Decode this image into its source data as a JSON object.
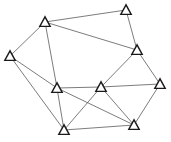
{
  "diagram": {
    "type": "undirected-graph",
    "node_shape": "triangle",
    "colors": {
      "background": "#ffffff",
      "edge": "#5a5a5a",
      "node_stroke": "#1a1a1a",
      "node_fill": "#ffffff"
    },
    "nodes": [
      {
        "id": "n1",
        "x": 45,
        "y": 22
      },
      {
        "id": "n2",
        "x": 126,
        "y": 10
      },
      {
        "id": "n3",
        "x": 10,
        "y": 56
      },
      {
        "id": "n4",
        "x": 137,
        "y": 50
      },
      {
        "id": "n5",
        "x": 57,
        "y": 88
      },
      {
        "id": "n6",
        "x": 101,
        "y": 87
      },
      {
        "id": "n7",
        "x": 160,
        "y": 84
      },
      {
        "id": "n8",
        "x": 64,
        "y": 130
      },
      {
        "id": "n9",
        "x": 134,
        "y": 125
      }
    ],
    "edges": [
      [
        "n1",
        "n2"
      ],
      [
        "n1",
        "n3"
      ],
      [
        "n1",
        "n4"
      ],
      [
        "n1",
        "n5"
      ],
      [
        "n2",
        "n4"
      ],
      [
        "n3",
        "n5"
      ],
      [
        "n3",
        "n8"
      ],
      [
        "n4",
        "n6"
      ],
      [
        "n4",
        "n7"
      ],
      [
        "n5",
        "n6"
      ],
      [
        "n5",
        "n8"
      ],
      [
        "n5",
        "n9"
      ],
      [
        "n6",
        "n7"
      ],
      [
        "n6",
        "n8"
      ],
      [
        "n6",
        "n9"
      ],
      [
        "n7",
        "n9"
      ],
      [
        "n8",
        "n9"
      ]
    ]
  }
}
